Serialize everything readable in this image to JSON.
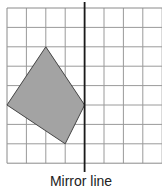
{
  "diagram": {
    "type": "reflection-grid",
    "grid": {
      "columns": 8,
      "rows": 8,
      "origin_px": [
        7,
        8
      ],
      "cell_px": 19.4,
      "line_color": "#9a9a9a",
      "border_color": "#8a8a8a"
    },
    "mirror_line": {
      "orientation": "vertical",
      "grid_x": 4,
      "color": "#1a1a1a",
      "label": "Mirror line"
    },
    "shape": {
      "name": "quadrilateral",
      "fill": "#a3a3a3",
      "stroke": "#444444",
      "vertices_grid": [
        [
          0,
          5
        ],
        [
          2,
          2
        ],
        [
          4,
          5
        ],
        [
          3,
          7
        ]
      ]
    }
  }
}
